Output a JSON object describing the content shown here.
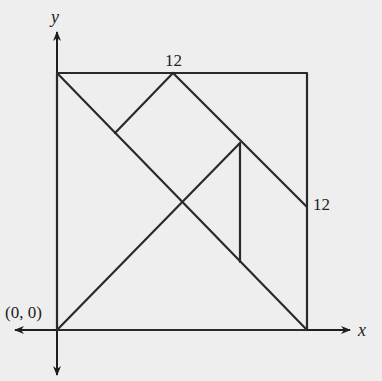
{
  "diagram": {
    "type": "tangram-square-on-coordinate-axes",
    "axes": {
      "x_label": "x",
      "y_label": "y",
      "origin_label": "(0, 0)"
    },
    "labels": {
      "top_midpoint": "12",
      "right_midpoint": "12"
    },
    "colors": {
      "background": "#eeeeee",
      "stroke": "#2a2a2a"
    }
  }
}
